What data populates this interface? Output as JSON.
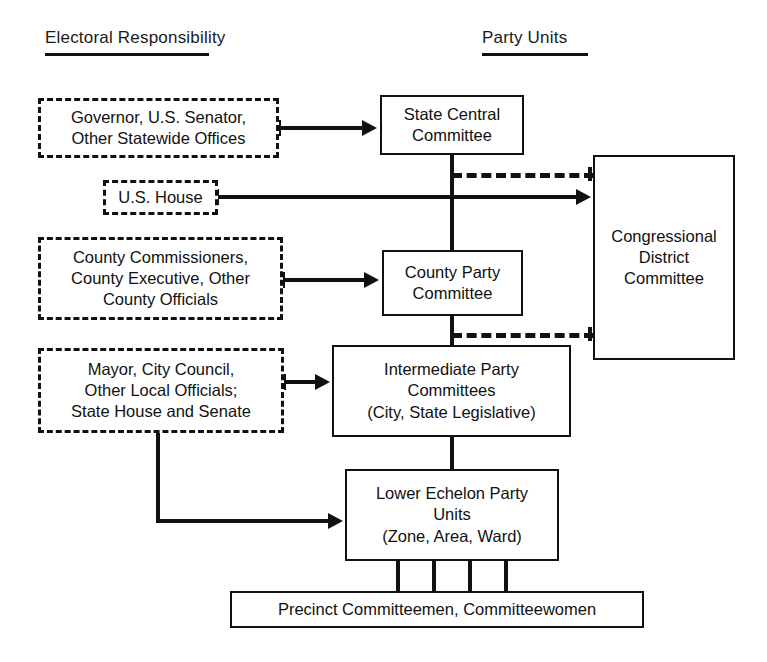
{
  "figure": {
    "headers": {
      "left": "Electoral Responsibility",
      "right": "Party Units"
    },
    "electoral_responsibility_nodes": [
      {
        "id": "statewide",
        "label": "Governor, U.S. Senator,\nOther Statewide Offices",
        "style": "dashed"
      },
      {
        "id": "us_house",
        "label": "U.S. House",
        "style": "dashed"
      },
      {
        "id": "county_off",
        "label": "County Commissioners,\nCounty Executive, Other\nCounty Officials",
        "style": "dashed"
      },
      {
        "id": "local_off",
        "label": "Mayor, City Council,\nOther Local Officials;\nState House and Senate",
        "style": "dashed"
      }
    ],
    "party_unit_nodes": [
      {
        "id": "state_central",
        "label": "State Central\nCommittee",
        "style": "solid"
      },
      {
        "id": "congressional",
        "label": "Congressional\nDistrict\nCommittee",
        "style": "solid"
      },
      {
        "id": "county_party",
        "label": "County Party\nCommittee",
        "style": "solid"
      },
      {
        "id": "intermediate",
        "label": "Intermediate Party\nCommittees\n(City, State Legislative)",
        "style": "solid"
      },
      {
        "id": "lower_echelon",
        "label": "Lower Echelon Party\nUnits\n(Zone, Area, Ward)",
        "style": "solid"
      },
      {
        "id": "precinct",
        "label": "Precinct Committeemen, Committeewomen",
        "style": "solid"
      }
    ],
    "connectors": [
      {
        "from": "statewide",
        "to": "state_central",
        "type": "arrow-solid"
      },
      {
        "from": "us_house",
        "to": "congressional",
        "type": "arrow-solid"
      },
      {
        "from": "county_off",
        "to": "county_party",
        "type": "arrow-solid"
      },
      {
        "from": "local_off",
        "to": "intermediate",
        "type": "arrow-solid"
      },
      {
        "from": "local_off",
        "to": "lower_echelon",
        "type": "arrow-solid-elbow"
      },
      {
        "from": "state_central",
        "to": "congressional",
        "type": "dashed"
      },
      {
        "from": "county_party",
        "to": "congressional",
        "type": "dashed"
      },
      {
        "from": "state_central",
        "to": "county_party",
        "type": "plain-solid"
      },
      {
        "from": "county_party",
        "to": "intermediate",
        "type": "plain-solid"
      },
      {
        "from": "intermediate",
        "to": "lower_echelon",
        "type": "plain-solid"
      },
      {
        "from": "lower_echelon",
        "to": "precinct",
        "type": "plain-solid-multi",
        "count": 4
      }
    ],
    "colors": {
      "ink": "#111111",
      "background": "#ffffff"
    }
  }
}
